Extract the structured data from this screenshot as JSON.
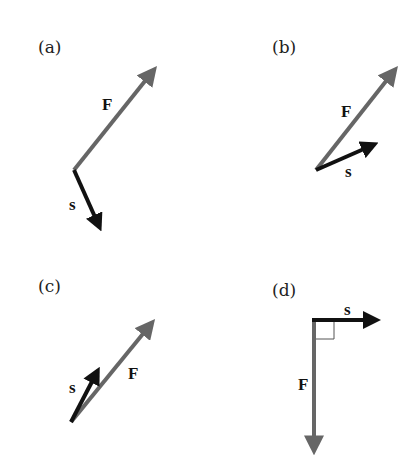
{
  "colors": {
    "force": "#666666",
    "displacement": "#111111",
    "background": "#ffffff"
  },
  "panels": [
    {
      "id": "a",
      "label": "(a)",
      "force_label": "F",
      "displacement_label": "s",
      "origin": [
        74,
        170
      ],
      "force_tip": [
        160,
        62
      ],
      "displacement_tip": [
        103,
        234
      ]
    },
    {
      "id": "b",
      "label": "(b)",
      "force_label": "F",
      "displacement_label": "s",
      "origin": [
        316,
        170
      ],
      "force_tip": [
        400,
        62
      ],
      "displacement_tip": [
        381,
        142
      ]
    },
    {
      "id": "c",
      "label": "(c)",
      "force_label": "F",
      "displacement_label": "s",
      "origin": [
        71,
        422
      ],
      "force_tip": [
        158,
        315
      ],
      "displacement_tip": [
        100,
        364
      ]
    },
    {
      "id": "d",
      "label": "(d)",
      "force_label": "F",
      "displacement_label": "s",
      "origin": [
        314,
        319
      ],
      "force_tip": [
        314,
        458
      ],
      "displacement_tip": [
        383,
        320
      ],
      "right_angle_marker": true
    }
  ]
}
